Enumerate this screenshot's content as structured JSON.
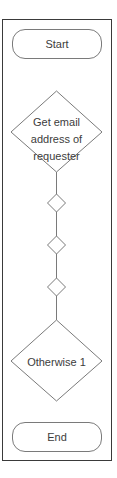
{
  "diagram": {
    "type": "flowchart",
    "colors": {
      "frame_border": "#3a3a3a",
      "shape_stroke": "#7a7a7a",
      "text": "#3c3c3c",
      "background": "#ffffff"
    },
    "nodes": [
      {
        "id": "start",
        "shape": "rounded-rectangle",
        "label": "Start"
      },
      {
        "id": "get-email",
        "shape": "diamond",
        "label_lines": [
          "Get email",
          "address of",
          "requester"
        ]
      },
      {
        "id": "decision-1",
        "shape": "small-diamond",
        "label": ""
      },
      {
        "id": "decision-2",
        "shape": "small-diamond",
        "label": ""
      },
      {
        "id": "decision-3",
        "shape": "small-diamond",
        "label": ""
      },
      {
        "id": "otherwise",
        "shape": "diamond",
        "label": "Otherwise 1"
      },
      {
        "id": "end",
        "shape": "rounded-rectangle",
        "label": "End"
      }
    ],
    "edges": [
      {
        "from": "get-email",
        "to": "decision-1"
      },
      {
        "from": "decision-1",
        "to": "decision-2"
      },
      {
        "from": "decision-2",
        "to": "decision-3"
      },
      {
        "from": "decision-3",
        "to": "otherwise"
      }
    ]
  }
}
